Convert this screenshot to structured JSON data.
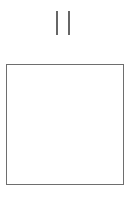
{
  "controls": {
    "pause": {
      "icon": "pause-icon",
      "label": "Pause",
      "color": "#666666"
    }
  },
  "canvas": {
    "border_color": "#6e6e6e",
    "background": "#ffffff",
    "content": ""
  }
}
